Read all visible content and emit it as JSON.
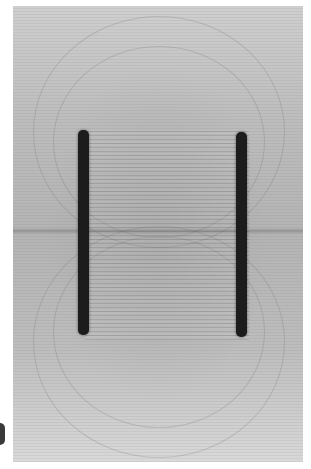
{
  "image": {
    "description": "Photograph of field-line pattern (filings/threads) between two parallel dark plates, showing uniform field between plates and fringing at ends",
    "plates": [
      {
        "name": "left-plate",
        "x": 78,
        "y_top": 130,
        "y_bottom": 333
      },
      {
        "name": "right-plate",
        "x": 236,
        "y_top": 132,
        "y_bottom": 335
      }
    ],
    "colors": {
      "background": "#ffffff",
      "photo_gray": "#bdbdbd",
      "plate": "#1c1c1c"
    }
  }
}
